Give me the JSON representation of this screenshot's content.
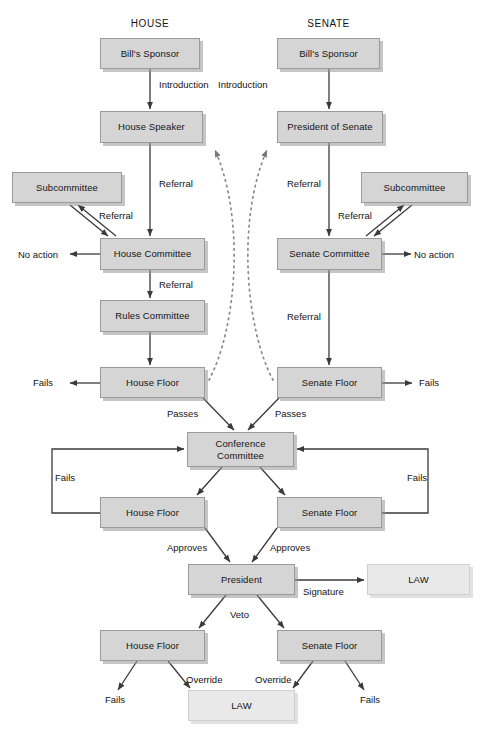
{
  "diagram": {
    "columns": [
      {
        "id": "house",
        "label": "HOUSE"
      },
      {
        "id": "senate",
        "label": "SENATE"
      }
    ],
    "nodes": [
      {
        "id": "house-sponsor",
        "label": "Bill's Sponsor",
        "x": 100,
        "y": 38,
        "w": 100,
        "h": 31,
        "style": "default"
      },
      {
        "id": "senate-sponsor",
        "label": "Bill's Sponsor",
        "x": 277,
        "y": 38,
        "w": 103,
        "h": 31,
        "style": "default"
      },
      {
        "id": "house-speaker",
        "label": "House Speaker",
        "x": 100,
        "y": 111,
        "w": 103,
        "h": 32,
        "style": "default"
      },
      {
        "id": "president-of-senate",
        "label": "President of Senate",
        "x": 277,
        "y": 111,
        "w": 106,
        "h": 32,
        "style": "default"
      },
      {
        "id": "house-subcommittee",
        "label": "Subcommittee",
        "x": 12,
        "y": 172,
        "w": 110,
        "h": 31,
        "style": "default"
      },
      {
        "id": "senate-subcommittee",
        "label": "Subcommittee",
        "x": 361,
        "y": 172,
        "w": 107,
        "h": 31,
        "style": "default"
      },
      {
        "id": "house-committee",
        "label": "House Committee",
        "x": 100,
        "y": 238,
        "w": 105,
        "h": 32,
        "style": "default"
      },
      {
        "id": "senate-committee",
        "label": "Senate Committee",
        "x": 277,
        "y": 238,
        "w": 105,
        "h": 32,
        "style": "default"
      },
      {
        "id": "rules-committee",
        "label": "Rules Committee",
        "x": 100,
        "y": 300,
        "w": 105,
        "h": 32,
        "style": "default"
      },
      {
        "id": "house-floor-1",
        "label": "House Floor",
        "x": 100,
        "y": 367,
        "w": 105,
        "h": 31,
        "style": "default"
      },
      {
        "id": "senate-floor-1",
        "label": "Senate Floor",
        "x": 277,
        "y": 367,
        "w": 105,
        "h": 31,
        "style": "default"
      },
      {
        "id": "conference-committee",
        "label": "Conference\nCommittee",
        "x": 187,
        "y": 432,
        "w": 107,
        "h": 35,
        "style": "default"
      },
      {
        "id": "house-floor-2",
        "label": "House Floor",
        "x": 100,
        "y": 497,
        "w": 105,
        "h": 31,
        "style": "default"
      },
      {
        "id": "senate-floor-2",
        "label": "Senate Floor",
        "x": 277,
        "y": 497,
        "w": 105,
        "h": 31,
        "style": "default"
      },
      {
        "id": "president",
        "label": "President",
        "x": 188,
        "y": 564,
        "w": 107,
        "h": 31,
        "style": "default"
      },
      {
        "id": "law-signature",
        "label": "LAW",
        "x": 367,
        "y": 564,
        "w": 103,
        "h": 31,
        "style": "law"
      },
      {
        "id": "house-floor-3",
        "label": "House Floor",
        "x": 100,
        "y": 630,
        "w": 105,
        "h": 31,
        "style": "default"
      },
      {
        "id": "senate-floor-3",
        "label": "Senate Floor",
        "x": 277,
        "y": 630,
        "w": 105,
        "h": 31,
        "style": "default"
      },
      {
        "id": "law-override",
        "label": "LAW",
        "x": 188,
        "y": 690,
        "w": 107,
        "h": 31,
        "style": "law"
      }
    ],
    "edge_labels": [
      {
        "id": "house-introduction",
        "text": "Introduction",
        "x": 159,
        "y": 79
      },
      {
        "id": "senate-introduction",
        "text": "Introduction",
        "x": 218,
        "y": 79
      },
      {
        "id": "house-referral-1",
        "text": "Referral",
        "x": 159,
        "y": 178
      },
      {
        "id": "senate-referral-1",
        "text": "Referral",
        "x": 287,
        "y": 178
      },
      {
        "id": "house-sub-referral",
        "text": "Referral",
        "x": 99,
        "y": 210
      },
      {
        "id": "senate-sub-referral",
        "text": "Referral",
        "x": 338,
        "y": 210
      },
      {
        "id": "house-referral-rules",
        "text": "Referral",
        "x": 159,
        "y": 279
      },
      {
        "id": "senate-referral-floor",
        "text": "Referral",
        "x": 287,
        "y": 311
      },
      {
        "id": "house-passes",
        "text": "Passes",
        "x": 167,
        "y": 408
      },
      {
        "id": "senate-passes",
        "text": "Passes",
        "x": 275,
        "y": 408
      },
      {
        "id": "house-conf-fails",
        "text": "Fails",
        "x": 55,
        "y": 472
      },
      {
        "id": "senate-conf-fails",
        "text": "Fails",
        "x": 407,
        "y": 472
      },
      {
        "id": "house-approves",
        "text": "Approves",
        "x": 167,
        "y": 542
      },
      {
        "id": "senate-approves",
        "text": "Approves",
        "x": 270,
        "y": 542
      },
      {
        "id": "signature",
        "text": "Signature",
        "x": 303,
        "y": 586
      },
      {
        "id": "veto",
        "text": "Veto",
        "x": 230,
        "y": 609
      },
      {
        "id": "house-override",
        "text": "Override",
        "x": 186,
        "y": 674
      },
      {
        "id": "senate-override",
        "text": "Override",
        "x": 255,
        "y": 674
      }
    ],
    "terminals": [
      {
        "id": "house-no-action",
        "text": "No action",
        "x": 18,
        "y": 249
      },
      {
        "id": "senate-no-action",
        "text": "No action",
        "x": 414,
        "y": 249
      },
      {
        "id": "house-floor-fails",
        "text": "Fails",
        "x": 33,
        "y": 377
      },
      {
        "id": "senate-floor-fails",
        "text": "Fails",
        "x": 419,
        "y": 377
      },
      {
        "id": "house-veto-fails",
        "text": "Fails",
        "x": 105,
        "y": 694
      },
      {
        "id": "senate-veto-fails",
        "text": "Fails",
        "x": 360,
        "y": 694
      }
    ],
    "colors": {
      "node_fill": "#d5d5d5",
      "node_border": "#9a9a9a",
      "law_fill": "#e9e9e9",
      "law_border": "#cfcfcf",
      "line": "#3a3a3a",
      "dotted_line": "#8a8a8a",
      "background": "#ffffff",
      "text": "#141414"
    }
  }
}
